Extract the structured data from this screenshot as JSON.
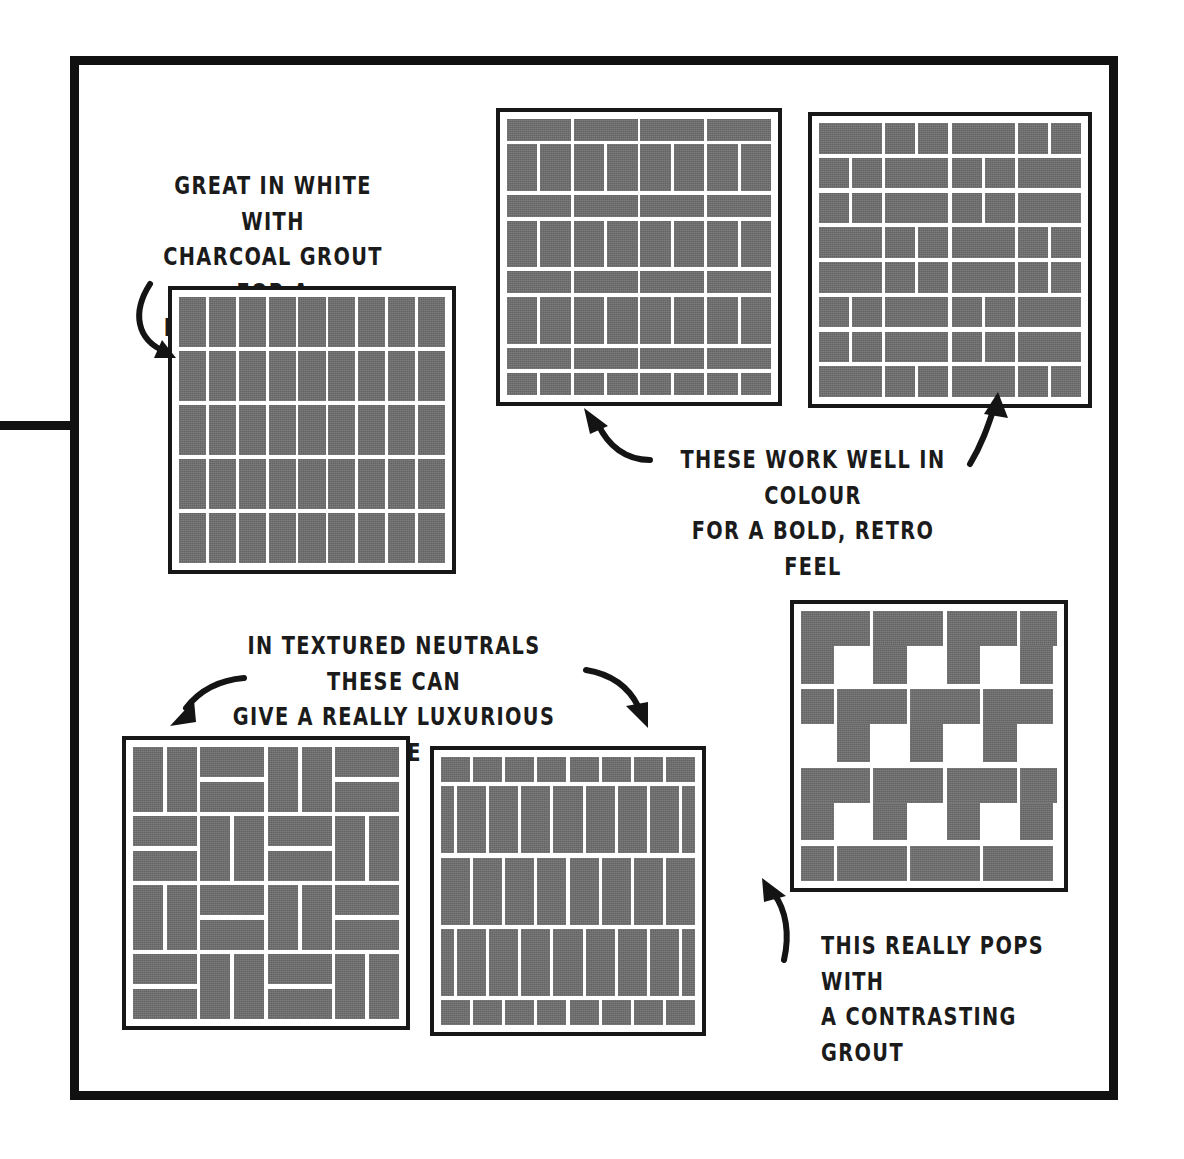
{
  "page": {
    "background_color": "#ffffff",
    "frame_color": "#111111",
    "tile_color": "#6e6e6e",
    "grout_color": "#ffffff",
    "ink_color": "#1b1b1b"
  },
  "frame": {
    "label": "hand-drawn-border",
    "tab_label": "left-edge-tab"
  },
  "captions": [
    {
      "id": "caption-stacked-grid",
      "text": "GREAT IN WHITE WITH\nCHARCOAL GROUT FOR A\nMODERN MINIMAL LOOK",
      "lines": [
        "GREAT IN WHITE WITH",
        "CHARCOAL GROUT FOR A",
        "MODERN MINIMAL LOOK"
      ],
      "align": "center"
    },
    {
      "id": "caption-colour-retro",
      "text": "THESE WORK WELL IN COLOUR\nFOR A BOLD, RETRO FEEL",
      "lines": [
        "THESE WORK WELL IN COLOUR",
        "FOR A BOLD, RETRO FEEL"
      ],
      "align": "center"
    },
    {
      "id": "caption-textured-neutrals",
      "text": "IN TEXTURED NEUTRALS THESE CAN\nGIVE A REALLY LUXURIOUS VIBE",
      "lines": [
        "IN TEXTURED NEUTRALS THESE CAN",
        "GIVE A REALLY LUXURIOUS VIBE"
      ],
      "align": "center"
    },
    {
      "id": "caption-contrasting-grout",
      "text": "THIS REALLY POPS WITH\nA CONTRASTING GROUT",
      "lines": [
        "THIS REALLY POPS WITH",
        "A CONTRASTING GROUT"
      ],
      "align": "left"
    }
  ],
  "panels": [
    {
      "id": "panel-stacked-grid",
      "pattern": "stacked-grid",
      "name": "Stacked grid / straight lay",
      "columns": 9,
      "rows": 5
    },
    {
      "id": "panel-banded-basketweave",
      "pattern": "banded-horizontal-vertical",
      "name": "Alternating horizontal and vertical bands",
      "bands": 6,
      "horizontal_per_band": 4,
      "vertical_per_band": 8
    },
    {
      "id": "panel-crosshatch-basketweave",
      "pattern": "basketweave-crosshatch",
      "name": "Basketweave crosshatch",
      "block_columns": 4,
      "block_rows": 4
    },
    {
      "id": "panel-double-basketweave",
      "pattern": "basketweave-pairs",
      "name": "Double basketweave",
      "block_columns": 4,
      "block_rows": 4
    },
    {
      "id": "panel-vertical-running-bond",
      "pattern": "vertical-running-bond",
      "name": "Vertical stacked running bond",
      "columns": 8,
      "rows": 5
    },
    {
      "id": "panel-herringbone",
      "pattern": "herringbone",
      "name": "Herringbone",
      "rows": 7
    }
  ],
  "arrows": [
    {
      "id": "arrow-to-stacked-grid",
      "direction": "down-right"
    },
    {
      "id": "arrow-to-banded-panel",
      "direction": "up-left"
    },
    {
      "id": "arrow-to-crosshatch-panel",
      "direction": "up-right"
    },
    {
      "id": "arrow-to-double-basketweave",
      "direction": "down-left"
    },
    {
      "id": "arrow-to-vertical-running-bond",
      "direction": "down-right"
    },
    {
      "id": "arrow-to-herringbone",
      "direction": "up"
    }
  ]
}
